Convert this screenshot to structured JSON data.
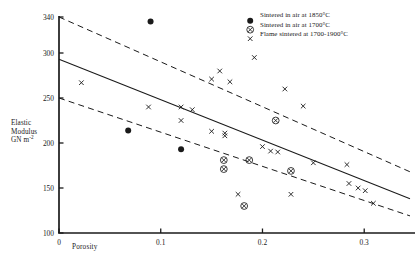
{
  "chart_data": {
    "type": "scatter",
    "title": "",
    "xlabel": "Porosity",
    "ylabel_lines": [
      "Elastic",
      "Modulus",
      "GN m"
    ],
    "ylabel_sup": "-2",
    "xlim": [
      0,
      0.345
    ],
    "ylim": [
      100,
      340
    ],
    "grid": false,
    "legend_position": "top-right",
    "xticks": [
      0,
      0.1,
      0.2,
      0.3
    ],
    "xtick_labels": [
      "0",
      "0.1",
      "0.2",
      "0.3"
    ],
    "yticks": [
      100,
      150,
      200,
      250,
      300,
      340
    ],
    "ytick_labels": [
      "100",
      "150",
      "200",
      "250",
      "300",
      "340"
    ],
    "series": [
      {
        "name": "Sintered in air at 1850°C",
        "marker": "filled-circle",
        "points": [
          [
            0.09,
            335
          ],
          [
            0.068,
            214
          ],
          [
            0.12,
            193
          ]
        ]
      },
      {
        "name": "Sintered in air at 1700°C",
        "marker": "circled-cross",
        "points": [
          [
            0.162,
            181
          ],
          [
            0.162,
            171
          ],
          [
            0.187,
            181
          ],
          [
            0.213,
            225
          ],
          [
            0.228,
            169
          ],
          [
            0.182,
            130
          ]
        ]
      },
      {
        "name": "Flame sintered at 1700-1900°C",
        "marker": "cross",
        "points": [
          [
            0.022,
            267
          ],
          [
            0.088,
            240
          ],
          [
            0.12,
            240
          ],
          [
            0.12,
            225
          ],
          [
            0.131,
            237
          ],
          [
            0.15,
            271
          ],
          [
            0.158,
            280
          ],
          [
            0.168,
            268
          ],
          [
            0.15,
            213
          ],
          [
            0.163,
            211
          ],
          [
            0.163,
            208
          ],
          [
            0.176,
            143
          ],
          [
            0.192,
            295
          ],
          [
            0.2,
            196
          ],
          [
            0.208,
            191
          ],
          [
            0.215,
            190
          ],
          [
            0.222,
            260
          ],
          [
            0.228,
            143
          ],
          [
            0.24,
            241
          ],
          [
            0.25,
            178
          ],
          [
            0.283,
            176
          ],
          [
            0.285,
            155
          ],
          [
            0.294,
            150
          ],
          [
            0.301,
            147
          ],
          [
            0.309,
            133
          ]
        ]
      }
    ],
    "trend_lines": [
      {
        "name": "upper-bound",
        "style": "dashed",
        "x0": 0.0,
        "y0": 340,
        "x1": 0.345,
        "y1": 168
      },
      {
        "name": "regression",
        "style": "solid",
        "x0": 0.0,
        "y0": 293,
        "x1": 0.345,
        "y1": 138
      },
      {
        "name": "lower-bound",
        "style": "dashed",
        "x0": 0.0,
        "y0": 250,
        "x1": 0.345,
        "y1": 119
      }
    ]
  },
  "legend": {
    "entries": [
      {
        "marker": "filled-circle",
        "label": "Sintered in air at 1850°C"
      },
      {
        "marker": "circled-cross",
        "label": "Sintered in air at 1700°C"
      },
      {
        "marker": "cross",
        "label": "Flame sintered at 1700-1900°C"
      }
    ]
  },
  "colors": {
    "ink": "#1a1a1a",
    "background": "#ffffff"
  }
}
